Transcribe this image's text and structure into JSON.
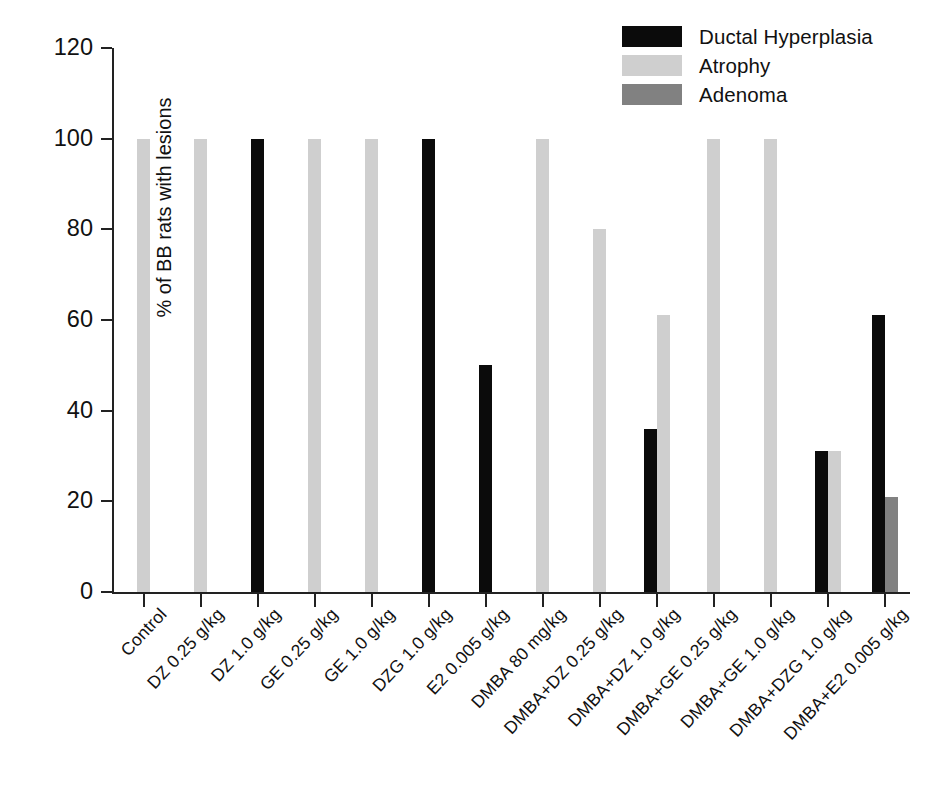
{
  "chart_data": {
    "type": "bar",
    "title": "",
    "xlabel": "",
    "ylabel": "% of BB rats with lesions",
    "ylim": [
      0,
      120
    ],
    "yticks": [
      0,
      20,
      40,
      60,
      80,
      100,
      120
    ],
    "grid": false,
    "legend_position": "top-right",
    "categories": [
      "Control",
      "DZ 0.25 g/kg",
      "DZ 1.0 g/kg",
      "GE 0.25 g/kg",
      "GE 1.0 g/kg",
      "DZG 1.0 g/kg",
      "E2 0.005 g/kg",
      "DMBA 80 mg/kg",
      "DMBA+DZ 0.25 g/kg",
      "DMBA+DZ 1.0 g/kg",
      "DMBA+GE 0.25 g/kg",
      "DMBA+GE 1.0 g/kg",
      "DMBA+DZG 1.0 g/kg",
      "DMBA+E2 0.005 g/kg"
    ],
    "series": [
      {
        "name": "Ductal Hyperplasia",
        "color": "#0b0b0b",
        "values": [
          0,
          0,
          100,
          0,
          0,
          100,
          50,
          0,
          0,
          36,
          0,
          0,
          31,
          61
        ]
      },
      {
        "name": "Atrophy",
        "color": "#cfcfcf",
        "values": [
          100,
          100,
          0,
          100,
          100,
          0,
          0,
          100,
          80,
          61,
          100,
          100,
          31,
          0
        ]
      },
      {
        "name": "Adenoma",
        "color": "#818181",
        "values": [
          0,
          0,
          0,
          0,
          0,
          0,
          0,
          0,
          0,
          0,
          0,
          0,
          0,
          21
        ]
      }
    ]
  },
  "legend": {
    "items": [
      {
        "label": "Ductal Hyperplasia",
        "color": "#0b0b0b"
      },
      {
        "label": "Atrophy",
        "color": "#cfcfcf"
      },
      {
        "label": "Adenoma",
        "color": "#818181"
      }
    ]
  },
  "axis": {
    "y_title": "% of BB rats with lesions",
    "y_tick_labels": [
      "0",
      "20",
      "40",
      "60",
      "80",
      "100",
      "120"
    ]
  }
}
